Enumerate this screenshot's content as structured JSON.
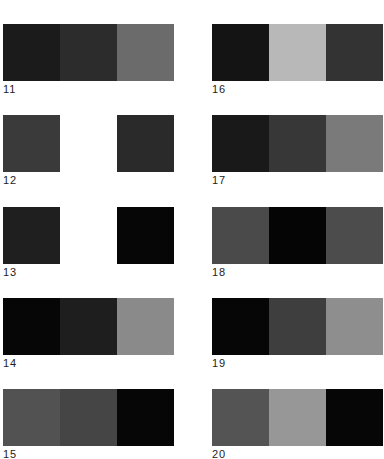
{
  "swatch_sets": [
    {
      "id": "11",
      "label": "11",
      "colors": [
        "#1b1b1b",
        "#2c2c2c",
        "#6b6b6b"
      ]
    },
    {
      "id": "12",
      "label": "12",
      "colors": [
        "#3a3a3a",
        "#ffffff",
        "#2a2a2a"
      ]
    },
    {
      "id": "13",
      "label": "13",
      "colors": [
        "#1f1f1f",
        "#ffffff",
        "#060606"
      ]
    },
    {
      "id": "14",
      "label": "14",
      "colors": [
        "#060606",
        "#1e1e1e",
        "#8a8a8a"
      ]
    },
    {
      "id": "15",
      "label": "15",
      "colors": [
        "#525252",
        "#454545",
        "#060606"
      ]
    },
    {
      "id": "16",
      "label": "16",
      "colors": [
        "#141414",
        "#b8b8b8",
        "#333333"
      ]
    },
    {
      "id": "17",
      "label": "17",
      "colors": [
        "#191919",
        "#373737",
        "#7a7a7a"
      ]
    },
    {
      "id": "18",
      "label": "18",
      "colors": [
        "#4a4a4a",
        "#050505",
        "#4c4c4c"
      ]
    },
    {
      "id": "19",
      "label": "19",
      "colors": [
        "#060606",
        "#3e3e3e",
        "#8e8e8e"
      ]
    },
    {
      "id": "20",
      "label": "20",
      "colors": [
        "#545454",
        "#979797",
        "#060606"
      ]
    }
  ]
}
